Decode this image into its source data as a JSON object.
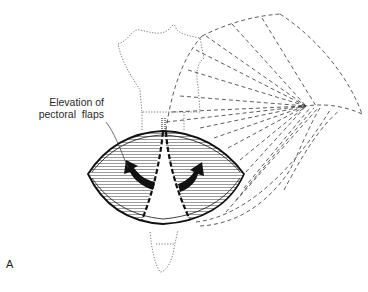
{
  "figure": {
    "panel_letter": "A",
    "callout": {
      "line1": "Elevation of",
      "line2": "pectoral  flaps"
    },
    "elements": [
      {
        "name": "sternum-outline",
        "style": "dotted"
      },
      {
        "name": "pectoralis-major-fan",
        "style": "dashed",
        "converges_to": "humerus-insertion"
      },
      {
        "name": "elliptical-incision",
        "style": "solid"
      },
      {
        "name": "left-flap",
        "style": "hatched"
      },
      {
        "name": "right-flap",
        "style": "hatched"
      },
      {
        "name": "left-elevation-arrow",
        "direction": "up-left"
      },
      {
        "name": "right-elevation-arrow",
        "direction": "up-right"
      }
    ],
    "colors": {
      "line": "#222222",
      "hatch": "#555555",
      "background": "#ffffff"
    }
  }
}
